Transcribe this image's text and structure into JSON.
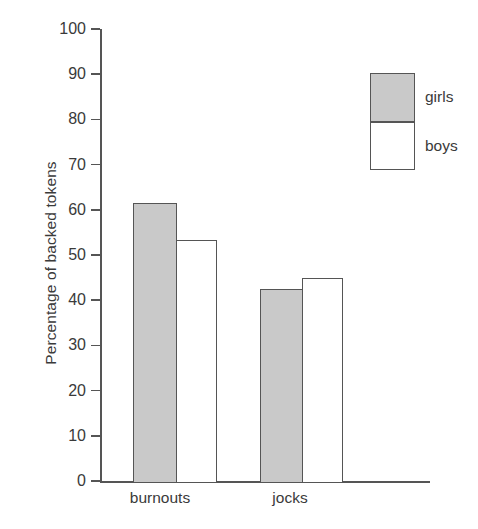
{
  "chart_data": {
    "type": "bar",
    "title": "",
    "xlabel": "",
    "ylabel": "Percentage of backed tokens",
    "categories": [
      "burnouts",
      "jocks"
    ],
    "series": [
      {
        "name": "girls",
        "values": [
          61.5,
          42.5
        ],
        "color": "#c9c9c9"
      },
      {
        "name": "boys",
        "values": [
          53.3,
          45.0
        ],
        "color": "#ffffff"
      }
    ],
    "ylim": [
      0,
      100
    ],
    "ytick_labels": [
      "0",
      "10",
      "20",
      "30",
      "40",
      "50",
      "60",
      "70",
      "80",
      "90",
      "100"
    ],
    "ytick_values": [
      0,
      10,
      20,
      30,
      40,
      50,
      60,
      70,
      80,
      90,
      100
    ],
    "grid": false,
    "legend_position": "upper right",
    "axis_color": "#555555",
    "text_color": "#3a3a3a",
    "background": "#ffffff"
  },
  "axis": {
    "y_title": "Percentage of backed tokens",
    "ticks": [
      {
        "label": "100",
        "value": 100
      },
      {
        "label": "90",
        "value": 90
      },
      {
        "label": "80",
        "value": 80
      },
      {
        "label": "70",
        "value": 70
      },
      {
        "label": "60",
        "value": 60
      },
      {
        "label": "50",
        "value": 50
      },
      {
        "label": "40",
        "value": 40
      },
      {
        "label": "30",
        "value": 30
      },
      {
        "label": "20",
        "value": 20
      },
      {
        "label": "10",
        "value": 10
      },
      {
        "label": "0",
        "value": 0
      }
    ],
    "x_labels": [
      "burnouts",
      "jocks"
    ]
  },
  "legend": {
    "items": [
      {
        "label": "girls",
        "swatch": "gray"
      },
      {
        "label": "boys",
        "swatch": "white"
      }
    ]
  },
  "bars": [
    {
      "group": "burnouts",
      "series": "girls",
      "value": 61.5
    },
    {
      "group": "burnouts",
      "series": "boys",
      "value": 53.3
    },
    {
      "group": "jocks",
      "series": "girls",
      "value": 42.5
    },
    {
      "group": "jocks",
      "series": "boys",
      "value": 45.0
    }
  ]
}
